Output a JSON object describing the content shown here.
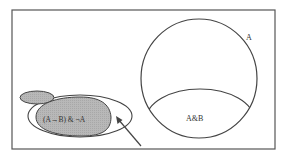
{
  "diagram": {
    "type": "venn-diagram",
    "labels": {
      "set_a": "A",
      "intersection_ab": "A&B",
      "shaded_region": "(A→B) & ¬A"
    },
    "colors": {
      "stroke": "#444444",
      "shaded_fill": "#b8b8b8",
      "background": "#ffffff",
      "frame": "#555555"
    },
    "elements": [
      {
        "name": "frame",
        "kind": "rectangle"
      },
      {
        "name": "circle-a",
        "kind": "circle",
        "label": "A"
      },
      {
        "name": "region-a-and-b",
        "kind": "ellipse-segment",
        "label": "A&B"
      },
      {
        "name": "region-not-a",
        "kind": "shaded-ellipse",
        "label": "(A→B) & ¬A"
      },
      {
        "name": "region-not-a-small-blob",
        "kind": "shaded-ellipse"
      },
      {
        "name": "outer-ellipse",
        "kind": "ellipse"
      },
      {
        "name": "pointer-arrow",
        "kind": "arrow"
      }
    ]
  }
}
